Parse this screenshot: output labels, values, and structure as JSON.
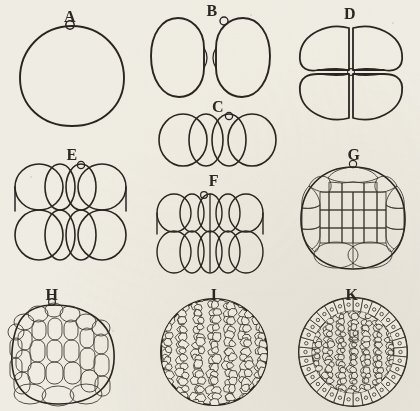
{
  "plate": {
    "title": "Cleavage and blastula stages",
    "medium": "ink line engraving on aged paper",
    "paper_color": "#efece3",
    "ink_color": "#2a2520",
    "label_sequence": [
      "A",
      "B",
      "C",
      "D",
      "E",
      "F",
      "G",
      "H",
      "I",
      "K"
    ],
    "note": "Letter J is omitted from the sequence."
  },
  "panels": [
    {
      "id": "a",
      "label": "A",
      "stage": "one-cell zygote",
      "cell_count": 1,
      "polar_body": true,
      "description": "single large spherical cell with polar body at the animal pole"
    },
    {
      "id": "b",
      "label": "B",
      "stage": "two-cell stage",
      "cell_count": 2,
      "polar_body": true,
      "description": "two blastomeres separated by a deep cleavage furrow"
    },
    {
      "id": "c",
      "label": "C",
      "stage": "four-cell stage, side view",
      "cell_count": 4,
      "polar_body": true,
      "description": "four overlapping blastomeres arranged in a single row"
    },
    {
      "id": "d",
      "label": "D",
      "stage": "four-cell stage, polar view",
      "cell_count": 4,
      "polar_body": false,
      "description": "four blastomeres in quadrant arrangement meeting at a central point"
    },
    {
      "id": "e",
      "label": "E",
      "stage": "eight-cell stage",
      "cell_count": 8,
      "polar_body": true,
      "description": "two tiers of four overlapping blastomeres"
    },
    {
      "id": "f",
      "label": "F",
      "stage": "sixteen-cell stage",
      "cell_count": 16,
      "polar_body": true,
      "description": "two tiers of smaller lens-shaped blastomeres in a grid"
    },
    {
      "id": "g",
      "label": "G",
      "stage": "early morula",
      "cell_count": 32,
      "polar_body": true,
      "description": "many small cells around the periphery with larger cells at the vegetal pole"
    },
    {
      "id": "h",
      "label": "H",
      "stage": "late morula",
      "cell_count": 64,
      "polar_body": true,
      "description": "tiers of elongated columnar cells, larger toward the vegetal pole"
    },
    {
      "id": "i",
      "label": "I",
      "stage": "blastula, surface view",
      "cell_count": 300,
      "polar_body": false,
      "description": "spherical blastula covered with numerous small polygonal cells"
    },
    {
      "id": "k",
      "label": "K",
      "stage": "blastula, optical section",
      "cell_count": 320,
      "polar_body": false,
      "description": "outer ring of nucleated columnar cells enclosing an inner mass of small cells"
    }
  ]
}
